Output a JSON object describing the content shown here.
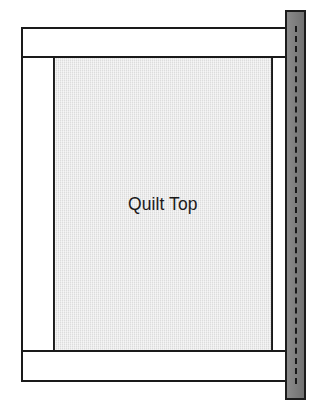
{
  "diagram": {
    "type": "quilting-frame-schematic",
    "canvas": {
      "width": 321,
      "height": 409,
      "background": "#ffffff"
    },
    "labels": {
      "quilt_top": "Quilt Top"
    },
    "parts": [
      {
        "id": "top-rail",
        "name": "top-rail",
        "label": "",
        "shape": "rectangle",
        "fill": "#ffffff",
        "stroke": "#1a1a1a",
        "x": 21,
        "y": 27,
        "width": 267,
        "height": 31
      },
      {
        "id": "bottom-rail",
        "name": "bottom-rail",
        "label": "",
        "shape": "rectangle",
        "fill": "#ffffff",
        "stroke": "#1a1a1a",
        "x": 21,
        "y": 350,
        "width": 267,
        "height": 32
      },
      {
        "id": "left-side-rail",
        "name": "left-side-rail",
        "label": "",
        "shape": "rectangle",
        "fill": "#ffffff",
        "stroke": "#1a1a1a",
        "x": 21,
        "y": 56,
        "width": 34,
        "height": 296
      },
      {
        "id": "right-side-rail",
        "name": "right-side-rail",
        "label": "",
        "shape": "rectangle",
        "fill": "#ffffff",
        "stroke": "#1a1a1a",
        "x": 271,
        "y": 56,
        "width": 17,
        "height": 296
      },
      {
        "id": "quilt-top-panel",
        "name": "quilt-top-panel",
        "label": "Quilt Top",
        "shape": "rectangle",
        "fill": "#dcdcdc",
        "stroke": "#262626",
        "texture": "fine-woven-fabric",
        "x": 54,
        "y": 56,
        "width": 218,
        "height": 296
      },
      {
        "id": "vertical-grey-rail",
        "name": "vertical-grey-rail",
        "label": "",
        "shape": "rectangle",
        "fill": "#7e7e7e",
        "stroke": "#1c1c1c",
        "center_line": "dashed",
        "center_line_color": "#181818",
        "x": 285,
        "y": 10,
        "width": 21,
        "height": 390
      }
    ],
    "colors": {
      "outline": "#1a1a1a",
      "quilt_fill": "#dcdcdc",
      "rail_grey": "#7e7e7e",
      "white": "#ffffff",
      "dash": "#181818"
    }
  }
}
